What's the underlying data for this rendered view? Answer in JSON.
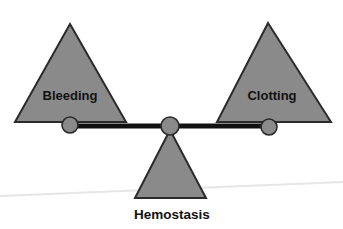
{
  "canvas": {
    "width": 343,
    "height": 229,
    "background": "#ffffff"
  },
  "colors": {
    "triangle_fill": "#8a8a8a",
    "triangle_stroke": "#2b2b2b",
    "beam": "#111111",
    "pivot_fill": "#8a8a8a",
    "pivot_stroke": "#2b2b2b",
    "text": "#111111",
    "ground_line": "#e6e6e6"
  },
  "diagram": {
    "type": "balance-scale",
    "left_weight": {
      "label": "Bleeding",
      "shape": "triangle",
      "apex_x": 70,
      "apex_y": 24,
      "base_left_x": 15,
      "base_right_x": 126,
      "base_y": 122,
      "label_x": 70,
      "label_y": 97
    },
    "right_weight": {
      "label": "Clotting",
      "shape": "triangle",
      "apex_x": 268,
      "apex_y": 23,
      "base_left_x": 217,
      "base_right_x": 331,
      "base_y": 122,
      "label_x": 272,
      "label_y": 97
    },
    "fulcrum": {
      "label": "Hemostasis",
      "shape": "triangle",
      "apex_x": 170,
      "apex_y": 130,
      "base_left_x": 135,
      "base_right_x": 206,
      "base_y": 198,
      "label_x": 172,
      "label_y": 215
    },
    "beam": {
      "left_x": 70,
      "right_x": 270,
      "y": 126,
      "thickness": 5
    },
    "pivots": [
      {
        "name": "left-pivot",
        "cx": 70,
        "cy": 125,
        "r": 8
      },
      {
        "name": "center-pivot",
        "cx": 170,
        "cy": 126,
        "r": 9
      },
      {
        "name": "right-pivot",
        "cx": 269,
        "cy": 127,
        "r": 8
      }
    ],
    "ground": {
      "x1": 0,
      "y1": 196,
      "x2": 343,
      "y2": 182
    },
    "state": "balanced"
  }
}
